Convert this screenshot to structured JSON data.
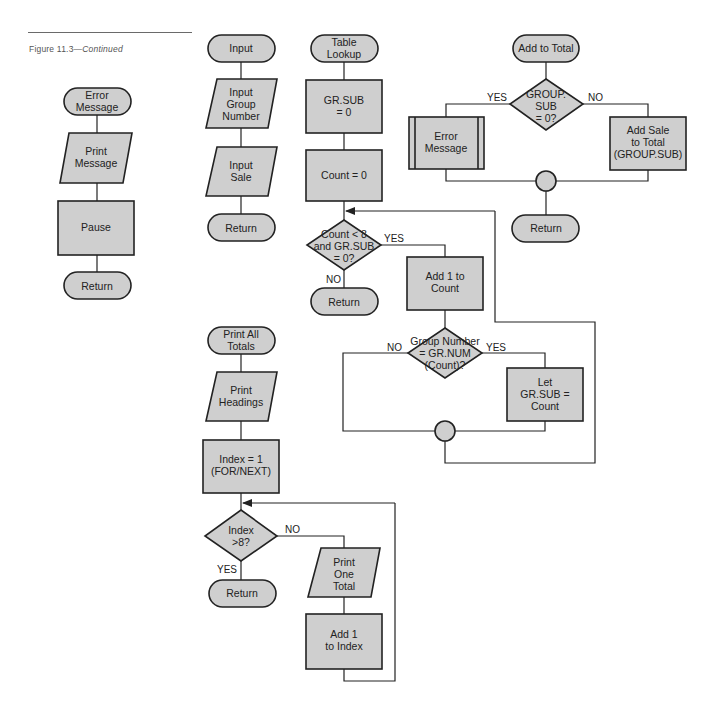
{
  "caption": {
    "figure": "Figure 11.3",
    "dash": "—",
    "suffix": "Continued"
  },
  "theme": {
    "shape_fill": "#cfcfcf",
    "stroke": "#222222",
    "background": "#ffffff"
  },
  "error_message_module": {
    "start": [
      "Error",
      "Message"
    ],
    "print": [
      "Print",
      "Message"
    ],
    "pause": "Pause",
    "end": "Return"
  },
  "input_module": {
    "start": "Input",
    "input_group": [
      "Input",
      "Group",
      "Number"
    ],
    "input_sale": [
      "Input",
      "Sale"
    ],
    "end": "Return"
  },
  "table_lookup_module": {
    "start": [
      "Table",
      "Lookup"
    ],
    "init_sub": [
      "GR.SUB",
      "= 0"
    ],
    "init_count": "Count  =  0",
    "decision": [
      "Count < 8",
      "and GR.SUB",
      "= 0?"
    ],
    "yes_label": "YES",
    "no_label": "NO",
    "end": "Return",
    "increment": [
      "Add 1 to",
      "Count"
    ],
    "match_decision": [
      "Group Number",
      "=  GR.NUM",
      "(Count)?"
    ],
    "match_no_label": "NO",
    "match_yes_label": "YES",
    "set_sub": [
      "Let",
      "GR.SUB  =",
      "Count"
    ]
  },
  "add_to_total_module": {
    "start": "Add to Total",
    "decision": [
      "GROUP.",
      "SUB",
      "= 0?"
    ],
    "yes_label": "YES",
    "no_label": "NO",
    "error": [
      "Error",
      "Message"
    ],
    "add_sale": [
      "Add Sale",
      "to Total",
      "(GROUP.SUB)"
    ],
    "end": "Return"
  },
  "print_all_totals_module": {
    "start": [
      "Print All",
      "Totals"
    ],
    "headings": [
      "Print",
      "Headings"
    ],
    "init_index": [
      "Index  =  1",
      "(FOR/NEXT)"
    ],
    "decision": [
      "Index",
      ">8?"
    ],
    "no_label": "NO",
    "yes_label": "YES",
    "end": "Return",
    "print_one": [
      "Print",
      "One",
      "Total"
    ],
    "increment": [
      "Add 1",
      "to Index"
    ]
  }
}
